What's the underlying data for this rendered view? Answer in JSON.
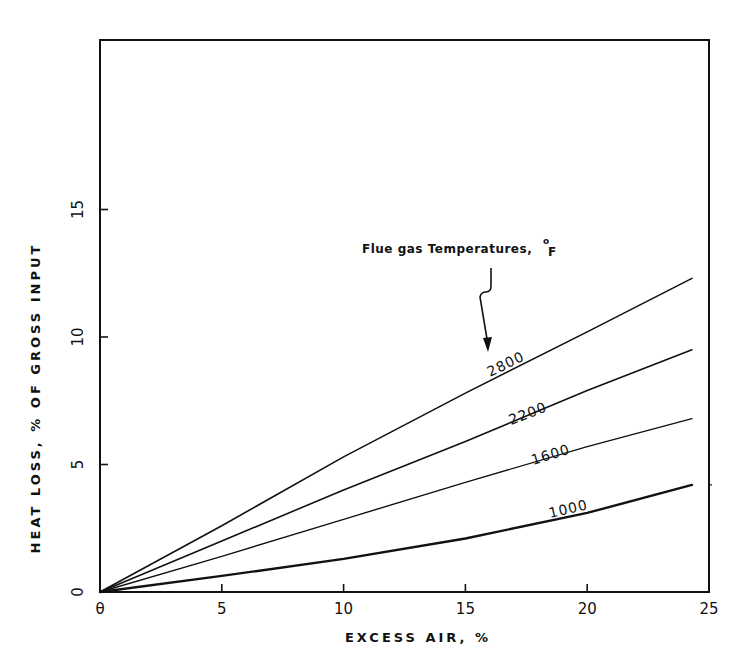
{
  "chart_data": {
    "type": "line",
    "title": "",
    "xlabel": "EXCESS AIR, %",
    "ylabel": "HEAT LOSS, % OF GROSS INPUT",
    "xlim": [
      0,
      25
    ],
    "ylim": [
      0,
      21.7
    ],
    "grid": false,
    "x_ticks": [
      "0",
      "5",
      "10",
      "15",
      "20",
      "25"
    ],
    "y_ticks": [
      "0",
      "5",
      "10",
      "15"
    ],
    "annotation": "Flue gas Temperatures, °F",
    "x": [
      0,
      5,
      10,
      15,
      20,
      24.3
    ],
    "series": [
      {
        "name": "2800",
        "values": [
          0,
          2.6,
          5.3,
          7.8,
          10.2,
          12.3
        ]
      },
      {
        "name": "2200",
        "values": [
          0,
          2.0,
          4.0,
          5.9,
          7.9,
          9.5
        ]
      },
      {
        "name": "1600",
        "values": [
          0,
          1.4,
          2.85,
          4.3,
          5.7,
          6.8
        ]
      },
      {
        "name": "1000",
        "values": [
          0,
          0.63,
          1.3,
          2.1,
          3.1,
          4.2
        ]
      }
    ]
  },
  "labels": {
    "x_axis_title": "EXCESS AIR, %",
    "y_axis_title": "HEAT LOSS, % OF GROSS INPUT",
    "annotation_main": "Flue gas Temperatures,",
    "annotation_unit": "F",
    "annotation_degree": "o",
    "x_origin_label": "θ"
  }
}
